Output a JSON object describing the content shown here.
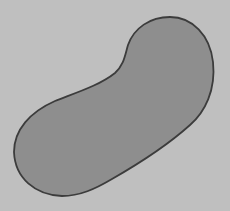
{
  "figure": {
    "description": "Gray kidney-bean shaped blob with dark outline on light gray background",
    "colors": {
      "background": "#bfbfbf",
      "fill": "#8e8e8e",
      "outline": "#3c3c3c"
    }
  }
}
